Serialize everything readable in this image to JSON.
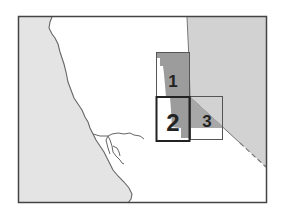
{
  "map": {
    "type": "locator-map",
    "colors": {
      "background": "#ffffff",
      "land_ocean_side": "#e4e4e4",
      "adjacent_region": "#d2d2d2",
      "study_area_shade": "#9c9c9c",
      "frame": "#444444",
      "coastline": "#666666",
      "box_outline": "#555555",
      "box_highlight": "#222222"
    },
    "boxes": [
      {
        "id": "1",
        "label": "1",
        "highlighted": false
      },
      {
        "id": "2",
        "label": "2",
        "highlighted": true
      },
      {
        "id": "3",
        "label": "3",
        "highlighted": false
      }
    ]
  }
}
